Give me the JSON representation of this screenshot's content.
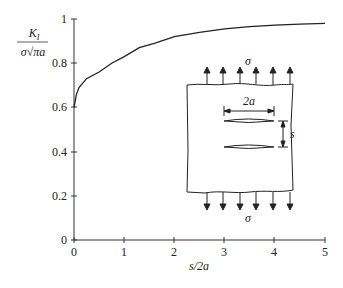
{
  "chart_data": {
    "type": "line",
    "title": "",
    "xlabel": "s/2a",
    "ylabel": "K_I / (σ√(πa))",
    "xlim": [
      0,
      5
    ],
    "ylim": [
      0,
      1
    ],
    "xticks": [
      "0",
      "1",
      "2",
      "3",
      "4",
      "5"
    ],
    "yticks": [
      "0",
      "0.2",
      "0.4",
      "0.6",
      "0.8",
      "1"
    ],
    "grid": false,
    "series": [
      {
        "name": "KI normalized",
        "x": [
          0,
          0.05,
          0.1,
          0.25,
          0.5,
          0.75,
          1.0,
          1.3,
          1.6,
          2.0,
          2.5,
          3.0,
          3.5,
          4.0,
          4.5,
          5.0
        ],
        "y": [
          0.6,
          0.66,
          0.69,
          0.73,
          0.76,
          0.8,
          0.83,
          0.87,
          0.89,
          0.92,
          0.94,
          0.955,
          0.965,
          0.972,
          0.977,
          0.98
        ]
      }
    ],
    "annotations": [
      "σ",
      "σ",
      "2a",
      "s"
    ]
  },
  "labels": {
    "y_num": "K",
    "y_sub": "I",
    "y_den": "σ√πa",
    "x": "s/2a",
    "sigma_top": "σ",
    "sigma_bottom": "σ",
    "crack_width": "2a",
    "spacing": "s"
  }
}
